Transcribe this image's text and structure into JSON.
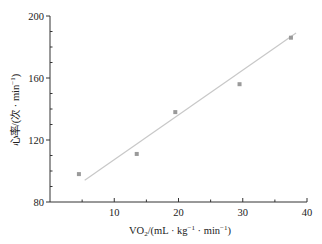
{
  "chart_data": {
    "type": "scatter",
    "title": "",
    "xlabel": "VO2/(mL·kg⁻¹·min⁻¹)",
    "ylabel": "心率/(次·min⁻¹)",
    "xlim": [
      0,
      40
    ],
    "ylim": [
      80,
      200
    ],
    "xticks": [
      10,
      20,
      30,
      40
    ],
    "yticks": [
      80,
      120,
      160,
      200
    ],
    "grid": false,
    "legend": null,
    "series": [
      {
        "name": "data",
        "x": [
          4.5,
          13.5,
          19.5,
          29.5,
          37.5
        ],
        "y": [
          98,
          111,
          138,
          156,
          186
        ]
      }
    ],
    "trendline": {
      "x": [
        5.4,
        38.3
      ],
      "y": [
        94,
        189
      ]
    },
    "colors": {
      "points": "#9a9a9a",
      "trendline": "#c8c8c8",
      "axis": "#333333"
    }
  }
}
